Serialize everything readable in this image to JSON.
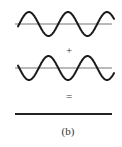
{
  "figure": {
    "caption": "(b)",
    "plus_sign": "+",
    "equals_sign": "="
  },
  "waves": [
    {
      "name": "wave-1",
      "center_y": 24,
      "amplitude": 12,
      "period": 39,
      "phase_x": 29,
      "sign": -1,
      "x_start": 18,
      "x_end": 114
    },
    {
      "name": "wave-2",
      "center_y": 68,
      "amplitude": 12,
      "period": 39,
      "phase_x": 29,
      "sign": 1,
      "x_start": 18,
      "x_end": 114
    }
  ],
  "axes": [
    {
      "y": 24,
      "x1": 15,
      "x2": 112
    },
    {
      "y": 68,
      "x1": 15,
      "x2": 112
    }
  ],
  "result_line": {
    "y": 114,
    "x1": 15,
    "x2": 112
  },
  "colors": {
    "wave": "#1a1a1a",
    "axis": "#777777",
    "result": "#222222",
    "text": "#333333"
  }
}
